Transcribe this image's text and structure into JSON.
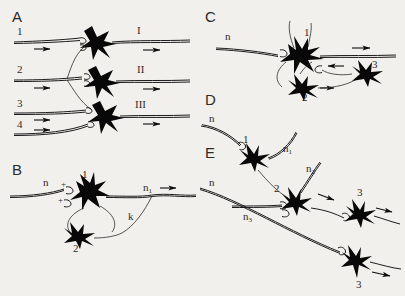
{
  "figure": {
    "background_color": "#f2f0ec",
    "ink_color": "#0d0d0d",
    "panels": [
      {
        "letter": "A",
        "description": "Convergent and divergent afferent input onto three output neurons",
        "input_labels": [
          "1",
          "2",
          "3",
          "4"
        ],
        "output_labels": [
          "I",
          "II",
          "III"
        ],
        "neuron_count": 3,
        "arrow_count": 7
      },
      {
        "letter": "B",
        "description": "Recurrent inhibitory loop with excitatory synapses marked plus",
        "fiber_labels": [
          "n",
          "n1"
        ],
        "neuron_labels": [
          "1",
          "2"
        ],
        "synapse_signs": [
          "+",
          "+"
        ],
        "collateral_label": "k",
        "arrow_count": 1
      },
      {
        "letter": "C",
        "description": "Afferent fiber n onto neuron 1 with interneurons 2 and 3 in feedback",
        "fiber_labels": [
          "n"
        ],
        "neuron_labels": [
          "1",
          "2",
          "3"
        ],
        "arrow_count": 3
      },
      {
        "letter": "D",
        "description": "Fiber n onto neuron 1 giving rise to fiber n1",
        "fiber_labels": [
          "n",
          "n1"
        ],
        "neuron_labels": [
          "1"
        ],
        "arrow_count": 0
      },
      {
        "letter": "E",
        "description": "Chain of neurons 2 and 3 with fibers n, n2 and n3",
        "fiber_labels": [
          "n",
          "n2",
          "n3"
        ],
        "neuron_labels": [
          "2",
          "3",
          "3"
        ],
        "arrow_count": 4
      }
    ]
  }
}
